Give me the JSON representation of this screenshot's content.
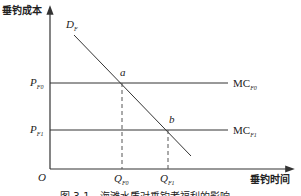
{
  "figure": {
    "y_axis_label": "垂钓成本",
    "x_axis_label": "垂钓时间",
    "origin_label": "O",
    "demand_curve": {
      "label": "D",
      "sub": "F"
    },
    "price_levels": [
      {
        "label": "P",
        "sub": "F0",
        "curve_label": "MC",
        "curve_sub": "F0"
      },
      {
        "label": "P",
        "sub": "F1",
        "curve_label": "MC",
        "curve_sub": "F1"
      }
    ],
    "points": [
      {
        "label": "a",
        "q_label": "Q",
        "q_sub": "F0"
      },
      {
        "label": "b",
        "q_label": "Q",
        "q_sub": "F1"
      }
    ],
    "caption": "图 3-1　海滩水质对垂钓者福利的影响",
    "colors": {
      "line": "#333333",
      "background": "#ffffff"
    }
  }
}
